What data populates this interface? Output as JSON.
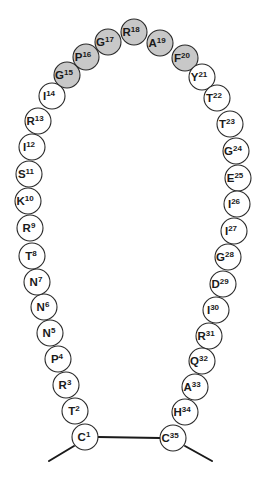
{
  "diagram": {
    "title": "",
    "colors": {
      "highlight_fill": "#c8c8c8",
      "normal_fill": "#ffffff",
      "stroke": "#2a2a2a",
      "bond": "#1a1a1a"
    },
    "circle_radius": 13,
    "residues": [
      {
        "letter": "C",
        "number": "1",
        "x": 85,
        "y": 437,
        "highlighted": false
      },
      {
        "letter": "T",
        "number": "2",
        "x": 75,
        "y": 411,
        "highlighted": false
      },
      {
        "letter": "R",
        "number": "3",
        "x": 66,
        "y": 385,
        "highlighted": false
      },
      {
        "letter": "P",
        "number": "4",
        "x": 58,
        "y": 359,
        "highlighted": false
      },
      {
        "letter": "N",
        "number": "5",
        "x": 50,
        "y": 333,
        "highlighted": false
      },
      {
        "letter": "N",
        "number": "6",
        "x": 44,
        "y": 307,
        "highlighted": false
      },
      {
        "letter": "N",
        "number": "7",
        "x": 37,
        "y": 282,
        "highlighted": false
      },
      {
        "letter": "T",
        "number": "8",
        "x": 32,
        "y": 256,
        "highlighted": false
      },
      {
        "letter": "R",
        "number": "9",
        "x": 30,
        "y": 228,
        "highlighted": false
      },
      {
        "letter": "K",
        "number": "10",
        "x": 28,
        "y": 201,
        "highlighted": false
      },
      {
        "letter": "S",
        "number": "11",
        "x": 29,
        "y": 174,
        "highlighted": false
      },
      {
        "letter": "I",
        "number": "12",
        "x": 32,
        "y": 147,
        "highlighted": false
      },
      {
        "letter": "R",
        "number": "13",
        "x": 38,
        "y": 121,
        "highlighted": false
      },
      {
        "letter": "I",
        "number": "14",
        "x": 52,
        "y": 96,
        "highlighted": false
      },
      {
        "letter": "G",
        "number": "15",
        "x": 67,
        "y": 75,
        "highlighted": true
      },
      {
        "letter": "P",
        "number": "16",
        "x": 86,
        "y": 57,
        "highlighted": true
      },
      {
        "letter": "G",
        "number": "17",
        "x": 108,
        "y": 42,
        "highlighted": true
      },
      {
        "letter": "R",
        "number": "18",
        "x": 134,
        "y": 32,
        "highlighted": true
      },
      {
        "letter": "A",
        "number": "19",
        "x": 160,
        "y": 43,
        "highlighted": true
      },
      {
        "letter": "F",
        "number": "20",
        "x": 185,
        "y": 58,
        "highlighted": true
      },
      {
        "letter": "Y",
        "number": "21",
        "x": 202,
        "y": 77,
        "highlighted": false
      },
      {
        "letter": "T",
        "number": "22",
        "x": 217,
        "y": 98,
        "highlighted": false
      },
      {
        "letter": "T",
        "number": "23",
        "x": 230,
        "y": 124,
        "highlighted": false
      },
      {
        "letter": "G",
        "number": "24",
        "x": 236,
        "y": 151,
        "highlighted": false
      },
      {
        "letter": "E",
        "number": "25",
        "x": 238,
        "y": 178,
        "highlighted": false
      },
      {
        "letter": "I",
        "number": "26",
        "x": 237,
        "y": 204,
        "highlighted": false
      },
      {
        "letter": "I",
        "number": "27",
        "x": 234,
        "y": 231,
        "highlighted": false
      },
      {
        "letter": "G",
        "number": "28",
        "x": 228,
        "y": 257,
        "highlighted": false
      },
      {
        "letter": "D",
        "number": "29",
        "x": 223,
        "y": 284,
        "highlighted": false
      },
      {
        "letter": "I",
        "number": "30",
        "x": 216,
        "y": 310,
        "highlighted": false
      },
      {
        "letter": "R",
        "number": "31",
        "x": 209,
        "y": 336,
        "highlighted": false
      },
      {
        "letter": "Q",
        "number": "32",
        "x": 202,
        "y": 361,
        "highlighted": false
      },
      {
        "letter": "A",
        "number": "33",
        "x": 195,
        "y": 387,
        "highlighted": false
      },
      {
        "letter": "H",
        "number": "34",
        "x": 185,
        "y": 412,
        "highlighted": false
      },
      {
        "letter": "C",
        "number": "35",
        "x": 173,
        "y": 438,
        "highlighted": false
      }
    ],
    "bonds": [
      {
        "name": "disulfide-bond",
        "x1": 98,
        "y1": 437,
        "x2": 160,
        "y2": 438
      },
      {
        "name": "n-terminal-tail",
        "x1": 74,
        "y1": 446,
        "x2": 49,
        "y2": 461
      },
      {
        "name": "c-terminal-tail",
        "x1": 185,
        "y1": 446,
        "x2": 212,
        "y2": 461
      }
    ]
  }
}
